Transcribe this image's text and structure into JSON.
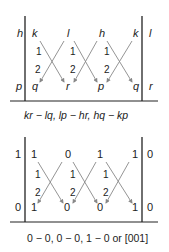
{
  "diagrams": [
    {
      "top_row": [
        "h",
        "k",
        "l",
        "h",
        "k",
        "l"
      ],
      "bottom_row": [
        "p",
        "q",
        "r",
        "p",
        "q",
        "r"
      ],
      "cross_labels": [
        "1",
        "2"
      ],
      "formula": "kr − lq, lp − hr, hq − kp",
      "italic": true
    },
    {
      "top_row": [
        "1",
        "1",
        "0",
        "1",
        "1",
        "0"
      ],
      "bottom_row": [
        "0",
        "1",
        "0",
        "0",
        "1",
        "0"
      ],
      "cross_labels": [
        "1",
        "2"
      ],
      "formula": "0 − 0, 0 − 0, 1 − 0 or [001]",
      "italic": false
    }
  ],
  "colors": {
    "line": "#222222",
    "arrow": "#888888",
    "text": "#222222"
  }
}
